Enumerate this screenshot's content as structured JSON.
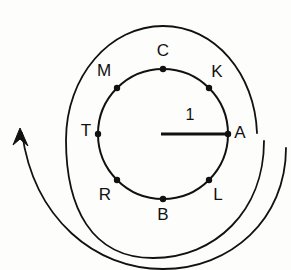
{
  "figure": {
    "background_color": "#fdfdfc",
    "stroke_color": "#111111",
    "canvas": {
      "width": 291,
      "height": 270
    }
  },
  "circle": {
    "center_x": 163,
    "center_y": 134,
    "radius": 65,
    "stroke_width": 2
  },
  "radius_line": {
    "label": "1",
    "label_x": 190,
    "label_y": 116,
    "from_x": 161,
    "from_y": 134,
    "to_x": 228,
    "to_y": 134,
    "stroke_width": 3
  },
  "points": [
    {
      "label": "A",
      "angle_deg": 0,
      "dot_x": 228,
      "dot_y": 134,
      "label_x": 240,
      "label_y": 134
    },
    {
      "label": "K",
      "angle_deg": 45,
      "dot_x": 209,
      "dot_y": 88,
      "label_x": 217,
      "label_y": 73
    },
    {
      "label": "C",
      "angle_deg": 90,
      "dot_x": 163,
      "dot_y": 69,
      "label_x": 163,
      "label_y": 52
    },
    {
      "label": "M",
      "angle_deg": 135,
      "dot_x": 117,
      "dot_y": 88,
      "label_x": 104,
      "label_y": 72
    },
    {
      "label": "T",
      "angle_deg": 180,
      "dot_x": 98,
      "dot_y": 134,
      "label_x": 86,
      "label_y": 132
    },
    {
      "label": "R",
      "angle_deg": 225,
      "dot_x": 117,
      "dot_y": 180,
      "label_x": 105,
      "label_y": 196
    },
    {
      "label": "B",
      "angle_deg": 270,
      "dot_x": 163,
      "dot_y": 199,
      "label_x": 163,
      "label_y": 216
    },
    {
      "label": "L",
      "angle_deg": 315,
      "dot_x": 209,
      "dot_y": 180,
      "label_x": 218,
      "label_y": 196
    }
  ],
  "dot_radius": 3.2,
  "spiral_arrow": {
    "description": "counterclockwise-rotation-arrow",
    "inner_arc_path": "M 264 141 C 264 211 215 258 153 258 C 91 258 66 207 66 140 C 66 76 110 26 163 26 C 215 26 255 74 257 133",
    "outer_arc_path": "M 286 148 C 286 219 231 269 163 269 C 95 269 34 219 22 133",
    "arrow_tip_x": 20,
    "arrow_tip_y": 128,
    "stroke_width": 1.8,
    "arrow_head_path": "M 20 128 L 13 145 L 20 139 L 28 146 Z"
  }
}
